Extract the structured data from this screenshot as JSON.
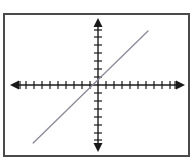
{
  "figure": {
    "kind": "coordinate-plane-graph",
    "background_color": "#ffffff",
    "frame": {
      "border_color": "#4a4a4a",
      "border_width": 2,
      "x": 3,
      "y": 13,
      "width": 187,
      "height": 144
    },
    "axis_color": "#1a1a1a",
    "line_color": "#8a8a9a",
    "title": "",
    "caption": ""
  },
  "chart_data": {
    "type": "line",
    "title": "",
    "subtitle": "",
    "xlabel": "",
    "ylabel": "",
    "grid": false,
    "legend": null,
    "legend_position": "none",
    "axes": {
      "origin_px": {
        "x": 98,
        "y": 85
      },
      "unit_px": 8,
      "x_axis": {
        "label": "",
        "tick_labels": [],
        "tick_spacing_units": 1,
        "arrows": "both",
        "pixel_start": 12,
        "pixel_end": 183,
        "range": [
          -10.5,
          10.5
        ],
        "tick_count_left": 10,
        "tick_count_right": 10
      },
      "y_axis": {
        "label": "",
        "tick_labels": [],
        "tick_spacing_units": 1,
        "arrows": "both",
        "pixel_start": 20,
        "pixel_end": 150,
        "range": [
          -8,
          8
        ],
        "tick_count_up": 7,
        "tick_count_down": 7
      }
    },
    "series": [
      {
        "name": "line",
        "kind": "straight-line",
        "slope": 1,
        "intercept": 0,
        "color": "#8a8a9a",
        "endpoints_px": [
          {
            "x": 33,
            "y": 143
          },
          {
            "x": 148,
            "y": 31
          }
        ],
        "endpoints_units": [
          {
            "x": -8.1,
            "y": -7.25
          },
          {
            "x": 6.25,
            "y": 6.75
          }
        ],
        "x": [
          -8.1,
          6.25
        ],
        "values": [
          -7.25,
          6.75
        ]
      }
    ]
  }
}
